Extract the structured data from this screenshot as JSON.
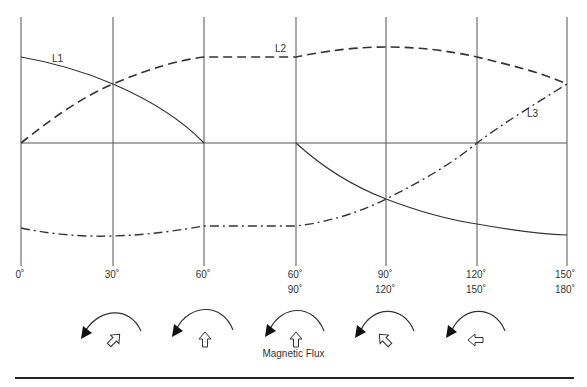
{
  "diagram": {
    "line_labels": {
      "l1": "L1",
      "l2": "L2",
      "l3": "L3"
    },
    "x_ticks_row1": [
      "0˚",
      "30˚",
      "60˚",
      "60˚",
      "90˚",
      "120˚",
      "150˚"
    ],
    "x_ticks_row2": [
      "",
      "",
      "",
      "90˚",
      "120˚",
      "150˚",
      "180˚"
    ],
    "caption": "Magnetic Flux",
    "flux_arrows": [
      {
        "direction": "up-right",
        "rotation_direction": "counterclockwise"
      },
      {
        "direction": "up",
        "rotation_direction": "counterclockwise"
      },
      {
        "direction": "up",
        "rotation_direction": "counterclockwise"
      },
      {
        "direction": "up-left",
        "rotation_direction": "counterclockwise"
      },
      {
        "direction": "left",
        "rotation_direction": "counterclockwise"
      }
    ],
    "lines": {
      "L1": {
        "style": "solid",
        "segments": [
          [
            [
              0,
              0.87
            ],
            [
              30,
              0.5
            ],
            [
              60,
              0
            ]
          ],
          [
            [
              60,
              0
            ],
            [
              90,
              -0.5
            ],
            [
              120,
              -0.7
            ],
            [
              150,
              -0.78
            ]
          ]
        ]
      },
      "L2": {
        "style": "dashed",
        "points": [
          [
            0,
            0
          ],
          [
            30,
            0.5
          ],
          [
            60,
            0.87
          ],
          [
            60,
            0.87
          ],
          [
            90,
            0.97
          ],
          [
            120,
            0.87
          ],
          [
            150,
            0.5
          ]
        ]
      },
      "L3": {
        "style": "dash-dot",
        "points": [
          [
            0,
            -0.72
          ],
          [
            30,
            -0.8
          ],
          [
            60,
            -0.71
          ],
          [
            60,
            -0.71
          ],
          [
            90,
            -0.5
          ],
          [
            120,
            0
          ],
          [
            150,
            0.5
          ]
        ]
      }
    }
  }
}
